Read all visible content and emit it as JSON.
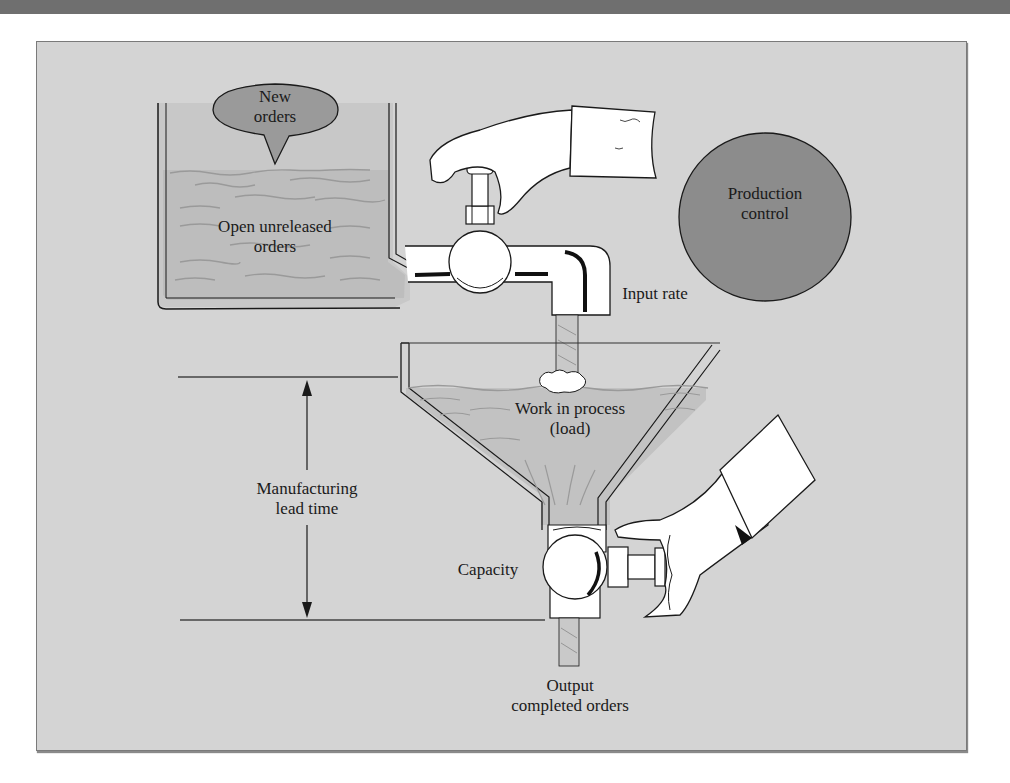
{
  "figure": {
    "labels": {
      "new_orders": "New\norders",
      "new_orders_line1": "New",
      "new_orders_line2": "orders",
      "open_unreleased_line1": "Open unreleased",
      "open_unreleased_line2": "orders",
      "production_control_line1": "Production",
      "production_control_line2": "control",
      "input_rate": "Input rate",
      "wip_line1": "Work in process",
      "wip_line2": "(load)",
      "lead_time_line1": "Manufacturing",
      "lead_time_line2": "lead time",
      "capacity": "Capacity",
      "output_line1": "Output",
      "output_line2": "completed orders"
    },
    "colors": {
      "background": "#d4d4d4",
      "bubble_fill": "#9a9a9a",
      "production_control_fill": "#8c8c8c",
      "liquid": "#c2c2c2",
      "outline": "#1a1a1a",
      "top_bar": "#6f6f6f"
    }
  }
}
